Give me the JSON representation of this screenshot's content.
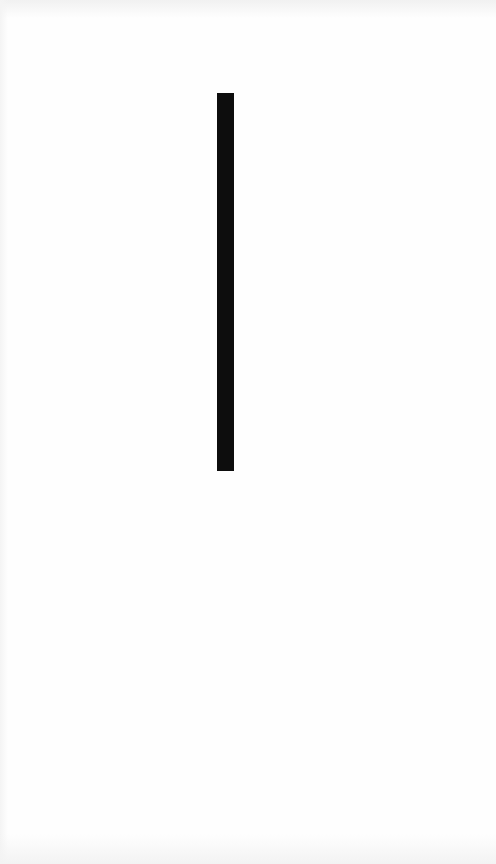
{
  "screen": {
    "background_color": "#fefefe"
  },
  "caret": {
    "icon": "text-cursor-bar",
    "color": "#0d0d0d"
  }
}
